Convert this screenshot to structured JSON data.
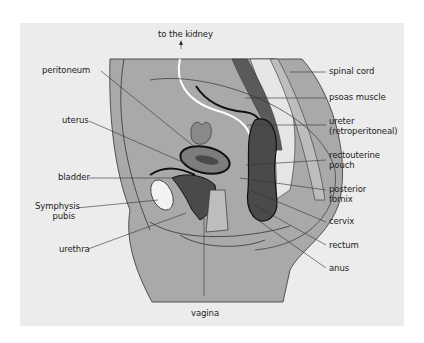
{
  "diagram": {
    "type": "anatomical-cross-section",
    "colors": {
      "background": "#ececec",
      "body_fill": "#a9a9a9",
      "organ_dark": "#4a4a4a",
      "organ_mid": "#7d7d7d",
      "line": "#333333"
    },
    "labels": {
      "top": "to the kidney",
      "peritoneum": "peritoneum",
      "uterus": "uterus",
      "bladder": "bladder",
      "symphysis_1": "Symphysis",
      "symphysis_2": "pubis",
      "urethra": "urethra",
      "vagina": "vagina",
      "spinal_cord": "spinal cord",
      "psoas": "psoas muscle",
      "ureter_1": "ureter",
      "ureter_2": "(retroperitoneal)",
      "rectouterine_1": "rectouterine",
      "rectouterine_2": "pouch",
      "posterior_1": "posterior",
      "posterior_2": "fornix",
      "cervix": "cervix",
      "rectum": "rectum",
      "anus": "anus"
    }
  }
}
